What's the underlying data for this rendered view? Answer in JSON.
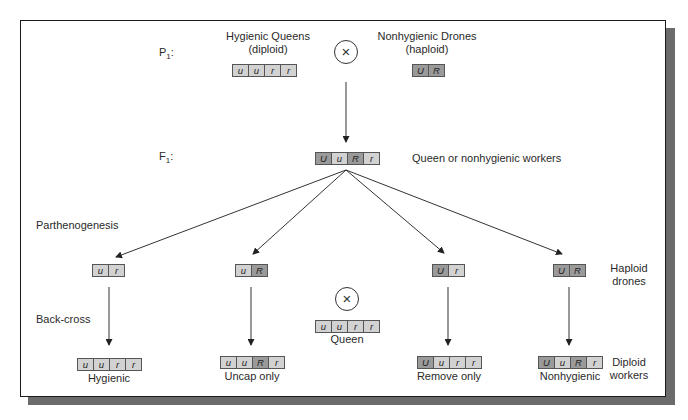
{
  "generations": {
    "p1_label": "P",
    "p1_sub": "1",
    "p1_colon": ":",
    "f1_label": "F",
    "f1_sub": "1",
    "f1_colon": ":"
  },
  "parents": {
    "queen": {
      "title": "Hygienic Queens",
      "ploidy": "(diploid)",
      "alleles": [
        "u",
        "u",
        "r",
        "r"
      ],
      "dominant": [
        false,
        false,
        false,
        false
      ]
    },
    "drone": {
      "title": "Nonhygienic Drones",
      "ploidy": "(haploid)",
      "alleles": [
        "U",
        "R"
      ],
      "dominant": [
        true,
        true
      ]
    },
    "cross_symbol": "×"
  },
  "f1": {
    "alleles": [
      "U",
      "u",
      "R",
      "r"
    ],
    "dominant": [
      true,
      false,
      true,
      false
    ],
    "caption": "Queen or nonhygienic workers"
  },
  "side_labels": {
    "parthenogenesis": "Parthenogenesis",
    "back_cross": "Back-cross",
    "haploid_drones_1": "Haploid",
    "haploid_drones_2": "drones",
    "diploid_workers_1": "Diploid",
    "diploid_workers_2": "workers"
  },
  "drones": [
    {
      "alleles": [
        "u",
        "r"
      ],
      "dominant": [
        false,
        false
      ]
    },
    {
      "alleles": [
        "u",
        "R"
      ],
      "dominant": [
        false,
        true
      ]
    },
    {
      "alleles": [
        "U",
        "r"
      ],
      "dominant": [
        true,
        false
      ]
    },
    {
      "alleles": [
        "U",
        "R"
      ],
      "dominant": [
        true,
        true
      ]
    }
  ],
  "backcross_queen": {
    "alleles": [
      "u",
      "u",
      "r",
      "r"
    ],
    "dominant": [
      false,
      false,
      false,
      false
    ],
    "label": "Queen",
    "cross_symbol": "×"
  },
  "workers": [
    {
      "alleles": [
        "u",
        "u",
        "r",
        "r"
      ],
      "dominant": [
        false,
        false,
        false,
        false
      ],
      "label": "Hygienic"
    },
    {
      "alleles": [
        "u",
        "u",
        "R",
        "r"
      ],
      "dominant": [
        false,
        false,
        true,
        false
      ],
      "label": "Uncap only"
    },
    {
      "alleles": [
        "U",
        "u",
        "r",
        "r"
      ],
      "dominant": [
        true,
        false,
        false,
        false
      ],
      "label": "Remove only"
    },
    {
      "alleles": [
        "U",
        "u",
        "R",
        "r"
      ],
      "dominant": [
        true,
        false,
        true,
        false
      ],
      "label": "Nonhygienic"
    }
  ],
  "colors": {
    "recessive_cell": "#d2d2d2",
    "dominant_cell": "#9a9a9a",
    "shadow": "#6b6b6b",
    "line": "#333333"
  }
}
